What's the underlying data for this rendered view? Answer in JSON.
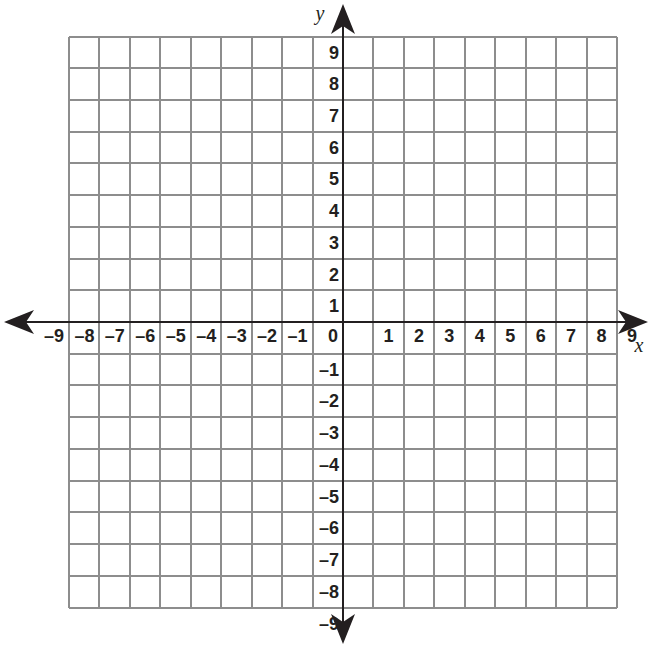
{
  "figure": {
    "kind": "coordinate-plane",
    "background_color": "#ffffff",
    "grid_color": "#8d8d8d",
    "axis_color": "#231f20",
    "label_color": "#231f20"
  },
  "axes": {
    "x_axis_name": "x",
    "y_axis_name": "y",
    "origin_label": "0"
  },
  "chart_data": {
    "type": "scatter",
    "title": "",
    "xlabel": "x",
    "ylabel": "y",
    "xlim": [
      -9,
      9
    ],
    "ylim": [
      -9,
      9
    ],
    "grid": true,
    "legend": false,
    "x_tick_labels": [
      "–9",
      "–8",
      "–7",
      "–6",
      "–5",
      "–4",
      "–3",
      "–2",
      "–1",
      "0",
      "1",
      "2",
      "3",
      "4",
      "5",
      "6",
      "7",
      "8",
      "9"
    ],
    "x_tick_values": [
      -9,
      -8,
      -7,
      -6,
      -5,
      -4,
      -3,
      -2,
      -1,
      0,
      1,
      2,
      3,
      4,
      5,
      6,
      7,
      8,
      9
    ],
    "y_tick_labels": [
      "9",
      "8",
      "7",
      "6",
      "5",
      "4",
      "3",
      "2",
      "1",
      "0",
      "–1",
      "–2",
      "–3",
      "–4",
      "–5",
      "–6",
      "–7",
      "–8",
      "–9"
    ],
    "y_tick_values": [
      9,
      8,
      7,
      6,
      5,
      4,
      3,
      2,
      1,
      0,
      -1,
      -2,
      -3,
      -4,
      -5,
      -6,
      -7,
      -8,
      -9
    ],
    "series": [],
    "values": [],
    "annotations": []
  }
}
